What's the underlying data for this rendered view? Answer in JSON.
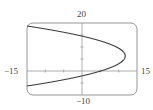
{
  "chart_data": {
    "type": "line",
    "title": "",
    "xlabel": "",
    "ylabel": "",
    "xlim": [
      -15,
      15
    ],
    "ylim": [
      -10,
      20
    ],
    "grid": false,
    "legend": null,
    "tick_labels": {
      "xmin": "−15",
      "xmax": "15",
      "ymin": "−10",
      "ymax": "20"
    },
    "x_ticks": [
      -10,
      -5,
      5,
      10
    ],
    "y_ticks": [
      -5,
      5,
      10,
      15
    ],
    "series": [
      {
        "name": "parabola opening left",
        "description": "sideways parabola x = f(y), vertex near (11.8, 6.25)",
        "points": [
          {
            "x": -15,
            "y": 18.75
          },
          {
            "x": -8.7,
            "y": 17.0
          },
          {
            "x": -3.7,
            "y": 15.5
          },
          {
            "x": 0,
            "y": 14.5
          },
          {
            "x": 4.1,
            "y": 12.9
          },
          {
            "x": 8.4,
            "y": 10.7
          },
          {
            "x": 11.1,
            "y": 8.25
          },
          {
            "x": 11.8,
            "y": 6.25
          },
          {
            "x": 11.1,
            "y": 4.25
          },
          {
            "x": 8.4,
            "y": 1.8
          },
          {
            "x": 5.1,
            "y": 0
          },
          {
            "x": 0,
            "y": -2.0
          },
          {
            "x": -3.7,
            "y": -3.0
          },
          {
            "x": -8.7,
            "y": -4.5
          },
          {
            "x": -15,
            "y": -6.25
          }
        ]
      }
    ]
  },
  "colors": {
    "curve": "#3a3a3a",
    "frame": "#8a8a8a",
    "axes": "#9a9a9a",
    "background": "#ffffff"
  }
}
